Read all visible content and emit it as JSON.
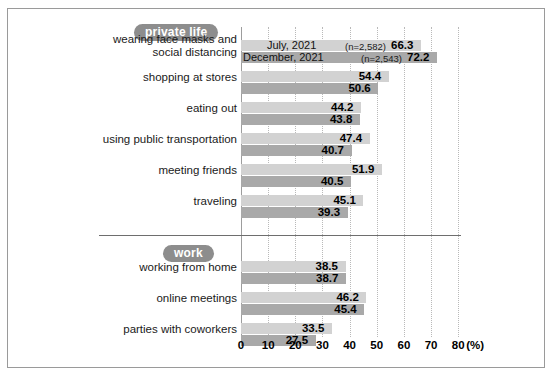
{
  "chart_data": {
    "type": "bar",
    "orientation": "horizontal",
    "title": "",
    "xlabel": "(%)",
    "ylabel": "",
    "xlim": [
      0,
      80
    ],
    "xticks": [
      0,
      10,
      20,
      30,
      40,
      50,
      60,
      70,
      80
    ],
    "grid": true,
    "legend": [
      "July, 2021",
      "December, 2021"
    ],
    "legend_position": "inside-first-bars",
    "sample_size_labels": [
      "(n=2,582)",
      "(n=2,543)"
    ],
    "series": [
      {
        "name": "July, 2021",
        "color": "#d2d2d2"
      },
      {
        "name": "December, 2021",
        "color": "#a9a9a9"
      }
    ],
    "groups": [
      {
        "group_label": "private life",
        "categories": [
          "wearing face masks and social distancing",
          "shopping at stores",
          "eating out",
          "using public transportation",
          "meeting friends",
          "traveling"
        ],
        "values_july": [
          66.3,
          54.4,
          44.2,
          47.4,
          51.9,
          45.1
        ],
        "values_december": [
          72.2,
          50.6,
          43.8,
          40.7,
          40.5,
          39.3
        ]
      },
      {
        "group_label": "work",
        "categories": [
          "working from home",
          "online meetings",
          "parties with coworkers"
        ],
        "values_july": [
          38.5,
          46.2,
          33.5
        ],
        "values_december": [
          38.7,
          45.4,
          27.5
        ]
      }
    ]
  },
  "pills": {
    "private": "private life",
    "work": "work"
  },
  "rows": [
    {
      "label_line1": "wearing face masks and",
      "label_line2": "social distancing",
      "a": "66.3",
      "b": "72.2",
      "na": "(n=2,582)",
      "nb": "(n=2,543)",
      "lega": "July, 2021",
      "legb": "December, 2021"
    },
    {
      "label_line1": "shopping at stores",
      "label_line2": "",
      "a": "54.4",
      "b": "50.6"
    },
    {
      "label_line1": "eating out",
      "label_line2": "",
      "a": "44.2",
      "b": "43.8"
    },
    {
      "label_line1": "using public transportation",
      "label_line2": "",
      "a": "47.4",
      "b": "40.7"
    },
    {
      "label_line1": "meeting friends",
      "label_line2": "",
      "a": "51.9",
      "b": "40.5"
    },
    {
      "label_line1": "traveling",
      "label_line2": "",
      "a": "45.1",
      "b": "39.3"
    },
    {
      "label_line1": "working from home",
      "label_line2": "",
      "a": "38.5",
      "b": "38.7"
    },
    {
      "label_line1": "online meetings",
      "label_line2": "",
      "a": "46.2",
      "b": "45.4"
    },
    {
      "label_line1": "parties with coworkers",
      "label_line2": "",
      "a": "33.5",
      "b": "27.5"
    }
  ],
  "axis": {
    "ticks": [
      "0",
      "10",
      "20",
      "30",
      "40",
      "50",
      "60",
      "70",
      "80"
    ],
    "unit": "(%)"
  },
  "colors": {
    "series_july": "#d2d2d2",
    "series_december": "#a9a9a9",
    "pill": "#8d8d8d",
    "frame": "#9a9a9a",
    "grid": "#b9b9b9"
  }
}
